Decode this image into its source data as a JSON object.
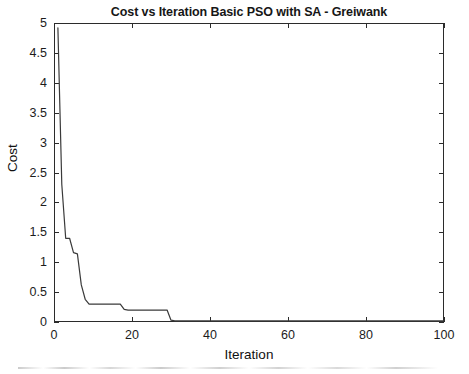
{
  "figure": {
    "background_color": "#ffffff",
    "axis_color": "#2b2b2b",
    "line_color": "#3a3a3a"
  },
  "chart_data": {
    "type": "line",
    "title": "Cost vs Iteration Basic PSO with SA - Greiwank",
    "xlabel": "Iteration",
    "ylabel": "Cost",
    "xlim": [
      0,
      100
    ],
    "ylim": [
      0,
      5
    ],
    "grid": false,
    "legend": null,
    "xticks": [
      0,
      20,
      40,
      60,
      80,
      100
    ],
    "xtick_labels": [
      "0",
      "20",
      "40",
      "60",
      "80",
      "100"
    ],
    "yticks": [
      0,
      0.5,
      1,
      1.5,
      2,
      2.5,
      3,
      3.5,
      4,
      4.5,
      5
    ],
    "ytick_labels": [
      "0",
      "0.5",
      "1",
      "1.5",
      "2",
      "2.5",
      "3",
      "3.5",
      "4",
      "4.5",
      "5"
    ],
    "series": [
      {
        "name": "Cost",
        "x": [
          1,
          2,
          3,
          4,
          5,
          6,
          7,
          8,
          9,
          10,
          11,
          12,
          13,
          14,
          15,
          16,
          17,
          18,
          19,
          20,
          21,
          22,
          23,
          24,
          25,
          26,
          27,
          28,
          29,
          30,
          31,
          32,
          33,
          34,
          35,
          36,
          37,
          38,
          39,
          40,
          45,
          50,
          55,
          60,
          65,
          70,
          75,
          80,
          85,
          90,
          95,
          100
        ],
        "y": [
          4.92,
          2.3,
          1.4,
          1.4,
          1.16,
          1.14,
          0.62,
          0.38,
          0.3,
          0.3,
          0.3,
          0.3,
          0.3,
          0.3,
          0.3,
          0.3,
          0.3,
          0.21,
          0.2,
          0.2,
          0.2,
          0.2,
          0.2,
          0.2,
          0.2,
          0.2,
          0.2,
          0.2,
          0.2,
          0.03,
          0.02,
          0.02,
          0.02,
          0.02,
          0.02,
          0.02,
          0.02,
          0.02,
          0.02,
          0.02,
          0.02,
          0.02,
          0.02,
          0.02,
          0.02,
          0.02,
          0.02,
          0.02,
          0.02,
          0.02,
          0.02,
          0.02
        ]
      }
    ],
    "annotations": []
  }
}
